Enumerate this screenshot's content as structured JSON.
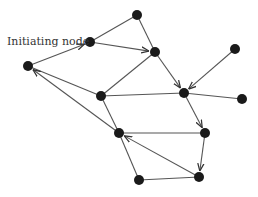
{
  "diagram": {
    "label": "Initiating node",
    "colors": {
      "node": "#1a1a1a",
      "edge": "#555555",
      "text": "#333333"
    },
    "nodes": [
      {
        "id": "A",
        "x": 90,
        "y": 42
      },
      {
        "id": "B",
        "x": 137,
        "y": 15
      },
      {
        "id": "C",
        "x": 155,
        "y": 52
      },
      {
        "id": "D",
        "x": 28,
        "y": 66
      },
      {
        "id": "E",
        "x": 101,
        "y": 96
      },
      {
        "id": "F",
        "x": 184,
        "y": 93
      },
      {
        "id": "G",
        "x": 235,
        "y": 49
      },
      {
        "id": "H",
        "x": 242,
        "y": 99
      },
      {
        "id": "I",
        "x": 119,
        "y": 133
      },
      {
        "id": "J",
        "x": 205,
        "y": 133
      },
      {
        "id": "K",
        "x": 139,
        "y": 180
      },
      {
        "id": "L",
        "x": 199,
        "y": 177
      }
    ],
    "edges": [
      {
        "from": "D",
        "to": "A",
        "arrow": true
      },
      {
        "from": "A",
        "to": "C",
        "arrow": true
      },
      {
        "from": "A",
        "to": "B",
        "arrow": false
      },
      {
        "from": "B",
        "to": "C",
        "arrow": false
      },
      {
        "from": "E",
        "to": "C",
        "arrow": false
      },
      {
        "from": "C",
        "to": "F",
        "arrow": true
      },
      {
        "from": "E",
        "to": "F",
        "arrow": false
      },
      {
        "from": "G",
        "to": "F",
        "arrow": true
      },
      {
        "from": "F",
        "to": "H",
        "arrow": false
      },
      {
        "from": "D",
        "to": "E",
        "arrow": false
      },
      {
        "from": "E",
        "to": "I",
        "arrow": false
      },
      {
        "from": "F",
        "to": "J",
        "arrow": true
      },
      {
        "from": "J",
        "to": "I",
        "arrow": false
      },
      {
        "from": "J",
        "to": "L",
        "arrow": true
      },
      {
        "from": "L",
        "to": "I",
        "arrow": true
      },
      {
        "from": "K",
        "to": "I",
        "arrow": false
      },
      {
        "from": "K",
        "to": "L",
        "arrow": false
      },
      {
        "from": "I",
        "to": "D",
        "arrow": true
      }
    ]
  }
}
